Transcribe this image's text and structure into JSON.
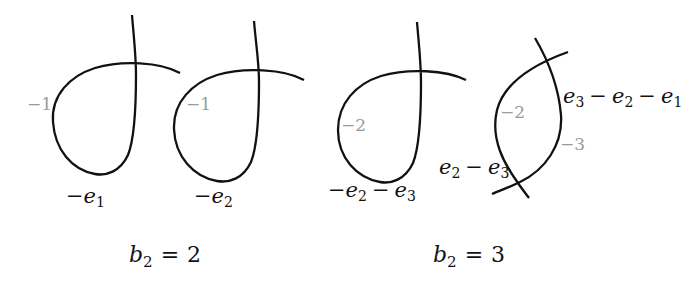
{
  "diagram": {
    "panels": [
      {
        "caption": {
          "var": "b",
          "sub": "2",
          "op": "=",
          "value": "2"
        },
        "figures": [
          {
            "type": "nodal-curve",
            "self_intersection_weight": "−1",
            "class_label": {
              "neg": "−",
              "terms": [
                {
                  "var": "e",
                  "sub": "1"
                }
              ]
            }
          },
          {
            "type": "nodal-curve",
            "self_intersection_weight": "−1",
            "class_label": {
              "neg": "−",
              "terms": [
                {
                  "var": "e",
                  "sub": "2"
                }
              ]
            }
          }
        ]
      },
      {
        "caption": {
          "var": "b",
          "sub": "2",
          "op": "=",
          "value": "3"
        },
        "figures": [
          {
            "type": "nodal-curve",
            "self_intersection_weight": "−2",
            "class_label": {
              "neg": "−",
              "terms": [
                {
                  "var": "e",
                  "sub": "2"
                },
                {
                  "op": "−"
                },
                {
                  "var": "e",
                  "sub": "3"
                }
              ]
            }
          },
          {
            "type": "two-curves-meeting-twice",
            "curves": [
              {
                "weight": "−2",
                "class_label": {
                  "terms": [
                    {
                      "var": "e",
                      "sub": "2"
                    },
                    {
                      "op": "−"
                    },
                    {
                      "var": "e",
                      "sub": "3"
                    }
                  ]
                }
              },
              {
                "weight": "−3",
                "class_label": {
                  "terms": [
                    {
                      "var": "e",
                      "sub": "3"
                    },
                    {
                      "op": "−"
                    },
                    {
                      "var": "e",
                      "sub": "2"
                    },
                    {
                      "op": "−"
                    },
                    {
                      "var": "e",
                      "sub": "1"
                    }
                  ]
                }
              }
            ]
          }
        ]
      }
    ]
  },
  "colors": {
    "curve": "#111111",
    "weight_label": "#9a9a9a",
    "text": "#111111",
    "background": "#ffffff"
  }
}
